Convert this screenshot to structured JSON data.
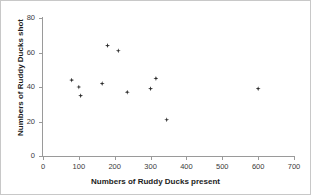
{
  "chart_data": {
    "type": "scatter",
    "title": "",
    "xlabel": "Numbers of Ruddy Ducks present",
    "ylabel": "Numbers of Ruddy Ducks shot",
    "xlim": [
      0,
      700
    ],
    "ylim": [
      0,
      80
    ],
    "xticks": [
      0,
      100,
      200,
      300,
      400,
      500,
      600,
      700
    ],
    "yticks": [
      0,
      20,
      40,
      60,
      80
    ],
    "xtick_labels": [
      "0",
      "100",
      "200",
      "300",
      "400",
      "500",
      "600",
      "700"
    ],
    "ytick_labels": [
      "0",
      "20",
      "40",
      "60",
      "80"
    ],
    "grid": false,
    "legend": false,
    "marker": "diamond",
    "marker_color": "#2b2b2b",
    "axis_color": "#9a9a9a",
    "points": [
      {
        "x": 80,
        "y": 44
      },
      {
        "x": 100,
        "y": 40
      },
      {
        "x": 105,
        "y": 35
      },
      {
        "x": 165,
        "y": 42
      },
      {
        "x": 180,
        "y": 64
      },
      {
        "x": 210,
        "y": 61
      },
      {
        "x": 235,
        "y": 37
      },
      {
        "x": 300,
        "y": 39
      },
      {
        "x": 315,
        "y": 45
      },
      {
        "x": 345,
        "y": 21
      },
      {
        "x": 600,
        "y": 39
      }
    ],
    "series": [
      {
        "name": "Ruddy Ducks",
        "x": [
          80,
          100,
          105,
          165,
          180,
          210,
          235,
          300,
          315,
          345,
          600
        ],
        "values": [
          44,
          40,
          35,
          42,
          64,
          61,
          37,
          39,
          45,
          21,
          39
        ]
      }
    ]
  }
}
